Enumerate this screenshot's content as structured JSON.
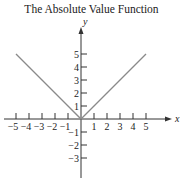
{
  "chart_data": {
    "type": "line",
    "title": "The Absolute Value Function",
    "xlabel": "x",
    "ylabel": "y",
    "function": "y = |x|",
    "series": [
      {
        "name": "y = |x|",
        "x": [
          -5,
          -4,
          -3,
          -2,
          -1,
          0,
          1,
          2,
          3,
          4,
          5
        ],
        "y": [
          5,
          4,
          3,
          2,
          1,
          0,
          1,
          2,
          3,
          4,
          5
        ],
        "color": "#8a8a8a"
      }
    ],
    "xlim": [
      -6,
      7
    ],
    "ylim": [
      -4.5,
      7
    ],
    "x_ticks": [
      -5,
      -4,
      -3,
      -2,
      -1,
      1,
      2,
      3,
      4,
      5
    ],
    "x_tick_labels": [
      "−5",
      "−4",
      "−3",
      "−2",
      "−1",
      "1",
      "2",
      "3",
      "4",
      "5"
    ],
    "y_ticks": [
      5,
      4,
      3,
      2,
      1,
      -1,
      -2,
      -3
    ],
    "y_tick_labels": [
      "5",
      "4",
      "3",
      "2",
      "1",
      "−1",
      "−2",
      "−3"
    ],
    "grid": false,
    "legend": "none"
  }
}
